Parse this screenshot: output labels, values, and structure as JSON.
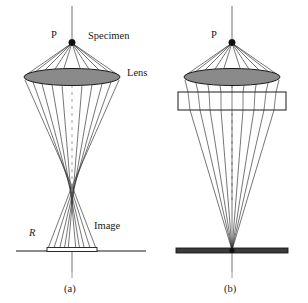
{
  "figure": {
    "background": "#ffffff",
    "ink_color": "#1a1a1a",
    "lens_fill": "#8a8a8a",
    "axis_color": "#9a9a9a",
    "panels": [
      {
        "id": "a",
        "caption": "(a)",
        "description": "Uncorrected lens: rays from point P cross the axis at different heights forming a caustic, producing a disc of least confusion of radius R in the image plane.",
        "labels": [
          {
            "key": "point",
            "text": "P"
          },
          {
            "key": "specimen",
            "text": "Specimen"
          },
          {
            "key": "lens",
            "text": "Lens"
          },
          {
            "key": "radius",
            "text": "R"
          },
          {
            "key": "image",
            "text": "Image"
          }
        ]
      },
      {
        "id": "b",
        "caption": "(b)",
        "description": "Corrected lens with an additional corrector element below the lens: all rays from point P converge to a single sharp point in the image plane.",
        "labels": [
          {
            "key": "point",
            "text": "P"
          }
        ]
      }
    ]
  }
}
